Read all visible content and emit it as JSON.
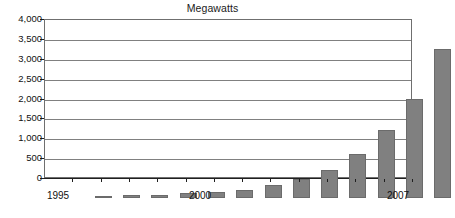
{
  "chart_data": {
    "type": "bar",
    "title": "Megawatts",
    "xlabel": "",
    "ylabel": "",
    "categories": [
      "1995",
      "1996",
      "1997",
      "1998",
      "1999",
      "2000",
      "2001",
      "2002",
      "2003",
      "2004",
      "2005",
      "2006",
      "2007"
    ],
    "values": [
      50,
      75,
      88,
      120,
      160,
      215,
      320,
      475,
      700,
      1120,
      1720,
      2480,
      3750
    ],
    "ylim": [
      0,
      4000
    ],
    "ytick_values": [
      0,
      500,
      1000,
      1500,
      2000,
      2500,
      3000,
      3500,
      4000
    ],
    "ytick_labels": [
      "0",
      "500",
      "1,000",
      "1,500",
      "2,000",
      "2,500",
      "3,000",
      "3,500",
      "4,000"
    ],
    "xtick_labels_shown": [
      "1995",
      "2000",
      "2007"
    ],
    "grid": "horizontal",
    "legend": "none",
    "bar_color": "#808080",
    "bar_border_color": "#6b6b6b",
    "gridline_color": "#808080",
    "axis_color": "#1f1f1f",
    "plot_background": "#ffffff",
    "text_color": "#111111"
  }
}
